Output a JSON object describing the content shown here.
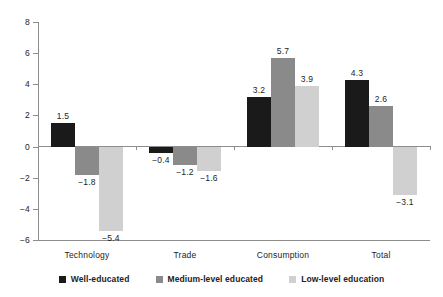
{
  "chart_data": {
    "type": "bar",
    "title": "",
    "subtitle": "",
    "xlabel": "",
    "ylabel": "",
    "ylim": [
      -6,
      8
    ],
    "yticks": [
      -6,
      -4,
      -2,
      0,
      2,
      4,
      6,
      8
    ],
    "ytick_labels": [
      "−6",
      "−4",
      "−2",
      "0",
      "2",
      "4",
      "6",
      "8"
    ],
    "grid": false,
    "legend_position": "bottom",
    "categories": [
      "Technology",
      "Trade",
      "Consumption",
      "Total"
    ],
    "series": [
      {
        "name": "Well-educated",
        "color": "#1a1a1a",
        "values": [
          1.5,
          -0.4,
          3.2,
          4.3
        ],
        "labels": [
          "1.5",
          "−0.4",
          "3.2",
          "4.3"
        ]
      },
      {
        "name": "Medium-level educated",
        "color": "#8a8a8a",
        "values": [
          -1.8,
          -1.2,
          5.7,
          2.6
        ],
        "labels": [
          "−1.8",
          "−1.2",
          "5.7",
          "2.6"
        ]
      },
      {
        "name": "Low-level education",
        "color": "#d0d0d0",
        "values": [
          -5.4,
          -1.6,
          3.9,
          -3.1
        ],
        "labels": [
          "−5.4",
          "−1.6",
          "3.9",
          "−3.1"
        ]
      }
    ]
  },
  "legend": {
    "items": [
      {
        "label": "Well-educated",
        "swatch": "legend-swatch-well-educated"
      },
      {
        "label": "Medium-level educated",
        "swatch": "legend-swatch-medium-level-educated"
      },
      {
        "label": "Low-level education",
        "swatch": "legend-swatch-low-level-education"
      }
    ]
  },
  "axis": {
    "y_tick_labels": [
      "8",
      "6",
      "4",
      "2",
      "0",
      "−2",
      "−4",
      "−6"
    ],
    "x_tick_labels": [
      "Technology",
      "Trade",
      "Consumption",
      "Total"
    ]
  },
  "colors": {
    "series_dark": "#1a1a1a",
    "series_medium": "#8a8a8a",
    "series_light": "#d0d0d0",
    "axis": "#8d8d8d",
    "text": "#232323",
    "background": "#ffffff"
  }
}
